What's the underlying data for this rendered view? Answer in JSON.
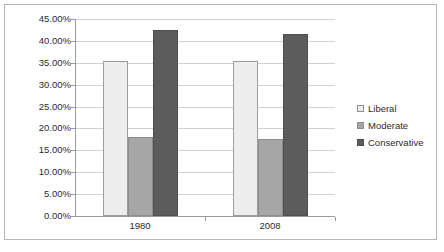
{
  "chart_data": {
    "type": "bar",
    "title": "",
    "xlabel": "",
    "ylabel": "",
    "categories": [
      "1980",
      "2008"
    ],
    "series": [
      {
        "name": "Liberal",
        "color": "#ededed",
        "values": [
          35.5,
          35.5
        ]
      },
      {
        "name": "Moderate",
        "color": "#a6a6a6",
        "values": [
          18.0,
          17.5
        ]
      },
      {
        "name": "Conservative",
        "color": "#5c5c5c",
        "values": [
          42.5,
          41.5
        ]
      }
    ],
    "ylim": [
      0,
      45
    ],
    "ytick_values": [
      0,
      5,
      10,
      15,
      20,
      25,
      30,
      35,
      40,
      45
    ],
    "ytick_labels": [
      "0.00%",
      "5.00%",
      "10.00%",
      "15.00%",
      "20.00%",
      "25.00%",
      "30.00%",
      "35.00%",
      "40.00%",
      "45.00%"
    ],
    "grid": true,
    "legend_position": "right",
    "legend_entries": [
      "Liberal",
      "Moderate",
      "Conservative"
    ]
  }
}
